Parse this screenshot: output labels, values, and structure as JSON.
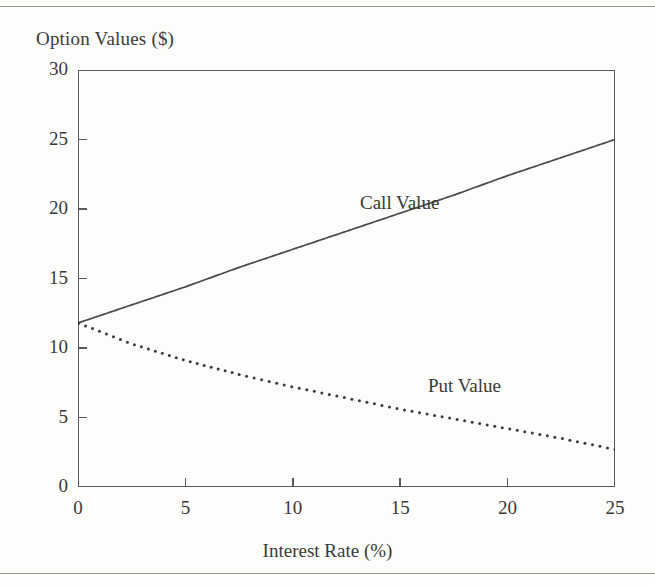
{
  "figure": {
    "background_color": "#fdfdfc",
    "ink_color": "#3a3a3a",
    "rule_color": "#9a9a96"
  },
  "chart_data": {
    "type": "line",
    "title": "",
    "xlabel": "Interest Rate (%)",
    "ylabel": "Option Values ($)",
    "xlim": [
      0,
      25
    ],
    "ylim": [
      0,
      30
    ],
    "xticks": [
      0,
      5,
      10,
      15,
      20,
      25
    ],
    "yticks": [
      0,
      5,
      10,
      15,
      20,
      25,
      30
    ],
    "xtick_labels": [
      "0",
      "5",
      "10",
      "15",
      "20",
      "25"
    ],
    "ytick_labels": [
      "0",
      "5",
      "10",
      "15",
      "20",
      "25",
      "30"
    ],
    "grid": false,
    "legend": "inline-annotations",
    "series": [
      {
        "name": "Call Value",
        "style": "solid",
        "color": "#4a4a48",
        "x": [
          0,
          2.5,
          5,
          7.5,
          10,
          12.5,
          15,
          17.5,
          20,
          22.5,
          25
        ],
        "values": [
          11.8,
          13.1,
          14.4,
          15.8,
          17.1,
          18.4,
          19.7,
          21.0,
          22.4,
          23.7,
          25.0
        ]
      },
      {
        "name": "Put Value",
        "style": "dotted",
        "color": "#3c3c3a",
        "x": [
          0,
          2.5,
          5,
          7.5,
          10,
          12.5,
          15,
          17.5,
          20,
          22.5,
          25
        ],
        "values": [
          11.8,
          10.3,
          9.1,
          8.1,
          7.2,
          6.4,
          5.6,
          4.9,
          4.2,
          3.5,
          2.7
        ]
      }
    ],
    "annotations": [
      {
        "text": "Call Value",
        "x": 15.0,
        "y": 21.2
      },
      {
        "text": "Put Value",
        "x": 18.5,
        "y": 8.3
      }
    ]
  }
}
